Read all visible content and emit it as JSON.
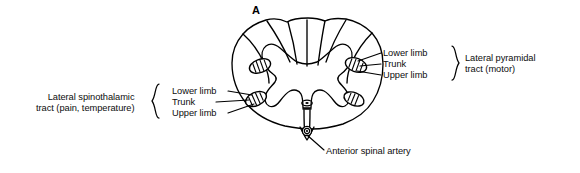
{
  "figure": {
    "panel_letter": "A",
    "background_color": "#ffffff",
    "ink_color": "#000000"
  },
  "labels": {
    "lateral_spinothalamic": {
      "line1": "Lateral spinothalamic",
      "line2": "tract (pain, temperature)"
    },
    "lateral_pyramidal": {
      "line1": "Lateral pyramidal",
      "line2": "tract (motor)"
    },
    "left_tract_parts": {
      "lower": "Lower limb",
      "trunk": "Trunk",
      "upper": "Upper limb"
    },
    "right_tract_parts": {
      "lower": "Lower limb",
      "trunk": "Trunk",
      "upper": "Upper limb"
    },
    "anterior_spinal_artery": "Anterior spinal artery"
  },
  "structures": {
    "cord_outline": "spinal-cord-cross-section",
    "gray_matter": "butterfly-gray-matter",
    "central_canal": "central-canal",
    "anterior_median_fissure": "anterior-median-fissure",
    "posterior_median_septum": "posterior-median-septum",
    "left_spinothalamic_tract": "hatched-oval-tract",
    "right_pyramidal_tract": "hatched-oval-tract",
    "left_upper_oval": "hatched-oval-tract",
    "right_lower_oval": "hatched-oval-tract",
    "anterior_spinal_artery_vessel": "concentric-circle-vessel"
  }
}
